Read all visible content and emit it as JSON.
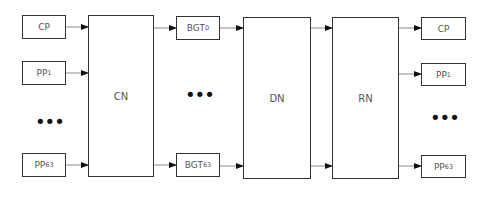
{
  "diagram": {
    "inputs": [
      {
        "id": "in-cp",
        "label": "CP",
        "sub": ""
      },
      {
        "id": "in-pp1",
        "label": "PP",
        "sub": "1"
      },
      {
        "id": "in-pp63",
        "label": "PP",
        "sub": "63"
      }
    ],
    "stages": [
      {
        "id": "cn",
        "label": "CN"
      },
      {
        "id": "dn",
        "label": "DN"
      },
      {
        "id": "rn",
        "label": "RN"
      }
    ],
    "intermediate": [
      {
        "id": "bgt0",
        "label": "BGT",
        "sub": "0"
      },
      {
        "id": "bgt63",
        "label": "BGT",
        "sub": "63"
      }
    ],
    "outputs": [
      {
        "id": "out-cp",
        "label": "CP",
        "sub": ""
      },
      {
        "id": "out-pp1",
        "label": "PP",
        "sub": "1"
      },
      {
        "id": "out-pp63",
        "label": "PP",
        "sub": "63"
      }
    ],
    "ellipsis": "•••",
    "colors": {
      "stroke": "#333333",
      "wire": "#888888",
      "arrow": "#111111",
      "text": "#555555"
    }
  }
}
